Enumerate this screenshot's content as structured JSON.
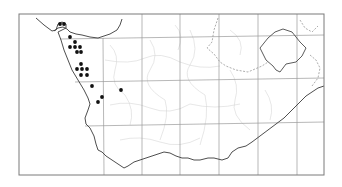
{
  "map": {
    "type": "distribution-map",
    "region": "South-western southern Africa",
    "colors": {
      "background": "#ffffff",
      "frame": "#7a7a7a",
      "coast": "#3a3a3a",
      "graticule": "#9a9a9a",
      "minor_boundaries": "#d0d0d0",
      "dashed_boundary": "#8a8a8a",
      "lesotho_border": "#4a4a4a",
      "dots": "#111111"
    },
    "frame": {
      "x": 19,
      "y": 14,
      "width": 305,
      "height": 161
    },
    "graticule": {
      "vertical_x": [
        103,
        142,
        180,
        219,
        258,
        297
      ],
      "horizontal_y": [
        38,
        81,
        125
      ]
    },
    "occurrence_points": [
      {
        "x": 60,
        "y": 24
      },
      {
        "x": 64,
        "y": 24
      },
      {
        "x": 70,
        "y": 37
      },
      {
        "x": 75,
        "y": 42
      },
      {
        "x": 70,
        "y": 47
      },
      {
        "x": 75,
        "y": 47
      },
      {
        "x": 80,
        "y": 47
      },
      {
        "x": 77,
        "y": 52
      },
      {
        "x": 81,
        "y": 52
      },
      {
        "x": 81,
        "y": 64
      },
      {
        "x": 77,
        "y": 69
      },
      {
        "x": 82,
        "y": 69
      },
      {
        "x": 87,
        "y": 69
      },
      {
        "x": 81,
        "y": 75
      },
      {
        "x": 87,
        "y": 75
      },
      {
        "x": 92,
        "y": 86
      },
      {
        "x": 121,
        "y": 90
      },
      {
        "x": 102,
        "y": 97
      },
      {
        "x": 98,
        "y": 102
      }
    ]
  }
}
